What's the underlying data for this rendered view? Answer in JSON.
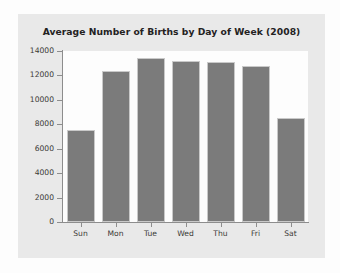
{
  "figure": {
    "background_color": "#fdfdfd",
    "card_color": "#e9e9e9",
    "plot_background_color": "#fdfdfd",
    "axis_color": "#8d8d8d"
  },
  "chart_data": {
    "type": "bar",
    "title": "Average Number of Births by Day of Week (2008)",
    "xlabel": "",
    "ylabel": "",
    "categories": [
      "Sun",
      "Mon",
      "Tue",
      "Wed",
      "Thu",
      "Fri",
      "Sat"
    ],
    "values": [
      7500,
      12400,
      13400,
      13200,
      13100,
      12800,
      8500
    ],
    "ylim": [
      0,
      14000
    ],
    "yticks": [
      0,
      2000,
      4000,
      6000,
      8000,
      10000,
      12000,
      14000
    ],
    "ytick_labels": [
      "0",
      "2000",
      "4000",
      "6000",
      "8000",
      "10000",
      "12000",
      "14000"
    ],
    "grid": false,
    "legend": false,
    "bar_color": "#7b7b7b",
    "bar_edge_color": "#c9c9c9",
    "series": [
      {
        "name": "Average Number of Births",
        "values": [
          7500,
          12400,
          13400,
          13200,
          13100,
          12800,
          8500
        ]
      }
    ]
  }
}
